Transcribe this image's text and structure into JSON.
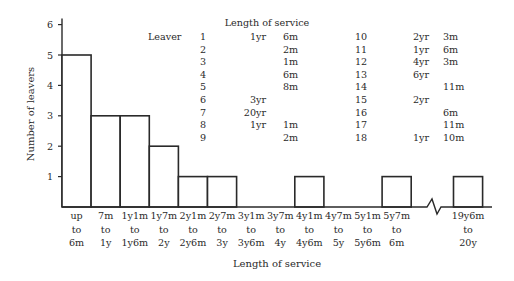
{
  "chart_data": {
    "type": "bar",
    "title": "",
    "xlabel": "Length of service",
    "ylabel": "Number of leavers",
    "ylim": [
      0,
      6
    ],
    "yticks": [
      "1",
      "2",
      "3",
      "4",
      "5",
      "6"
    ],
    "grid": false,
    "axis_break": "between 6m and 19y6m",
    "categories": [
      [
        "up",
        "to",
        "6m"
      ],
      [
        "7m",
        "to",
        "1y"
      ],
      [
        "1y1m",
        "to",
        "1y6m"
      ],
      [
        "1y7m",
        "to",
        "2y"
      ],
      [
        "2y1m",
        "to",
        "2y6m"
      ],
      [
        "2y7m",
        "to",
        "3y"
      ],
      [
        "3y1m",
        "to",
        "3y6m"
      ],
      [
        "3y7m",
        "to",
        "4y"
      ],
      [
        "4y1m",
        "to",
        "4y6m"
      ],
      [
        "4y7m",
        "to",
        "5y"
      ],
      [
        "5y1m",
        "to",
        "5y6m"
      ],
      [
        "5y7m",
        "to",
        "6m"
      ],
      [
        "19y6m",
        "to",
        "20y"
      ]
    ],
    "values": [
      5,
      3,
      3,
      2,
      1,
      1,
      0,
      0,
      1,
      0,
      0,
      1,
      1
    ],
    "inset_table": {
      "title": "Length of service",
      "row_header": "Leaver",
      "rows": [
        {
          "leaver": "1",
          "years": "1yr",
          "months": "6m"
        },
        {
          "leaver": "2",
          "years": "",
          "months": "2m"
        },
        {
          "leaver": "3",
          "years": "",
          "months": "1m"
        },
        {
          "leaver": "4",
          "years": "",
          "months": "6m"
        },
        {
          "leaver": "5",
          "years": "",
          "months": "8m"
        },
        {
          "leaver": "6",
          "years": "3yr",
          "months": ""
        },
        {
          "leaver": "7",
          "years": "20yr",
          "months": ""
        },
        {
          "leaver": "8",
          "years": "1yr",
          "months": "1m"
        },
        {
          "leaver": "9",
          "years": "",
          "months": "2m"
        },
        {
          "leaver": "10",
          "years": "2yr",
          "months": "3m"
        },
        {
          "leaver": "11",
          "years": "1yr",
          "months": "6m"
        },
        {
          "leaver": "12",
          "years": "4yr",
          "months": "3m"
        },
        {
          "leaver": "13",
          "years": "6yr",
          "months": ""
        },
        {
          "leaver": "14",
          "years": "",
          "months": "11m"
        },
        {
          "leaver": "15",
          "years": "2yr",
          "months": ""
        },
        {
          "leaver": "16",
          "years": "",
          "months": "6m"
        },
        {
          "leaver": "17",
          "years": "",
          "months": "11m"
        },
        {
          "leaver": "18",
          "years": "1yr",
          "months": "10m"
        }
      ]
    }
  }
}
